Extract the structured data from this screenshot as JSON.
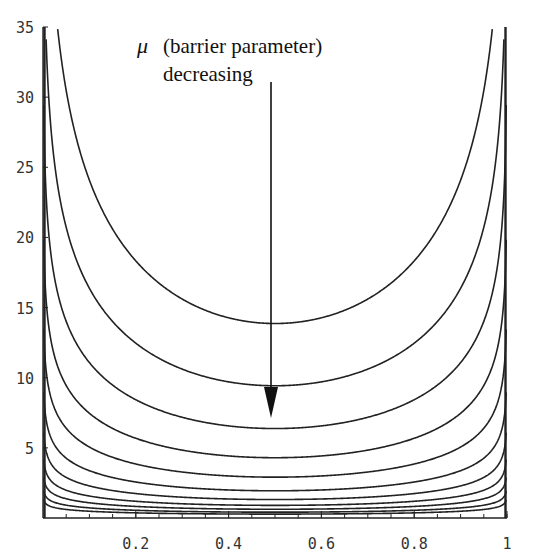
{
  "chart_data": {
    "type": "line",
    "title": "",
    "xlabel": "",
    "ylabel": "",
    "function": "f(x) = -mu * (ln(x) + ln(1 - x))",
    "xlim": [
      0,
      1
    ],
    "ylim": [
      0,
      35
    ],
    "x_ticks": [
      0.2,
      0.4,
      0.6,
      0.8,
      1
    ],
    "x_tick_labels": [
      "0.2",
      "0.4",
      "0.6",
      "0.8",
      "1"
    ],
    "x_minor_tick_step": 0.05,
    "y_ticks": [
      5,
      10,
      15,
      20,
      25,
      30,
      35
    ],
    "y_tick_labels": [
      "5",
      "10",
      "15",
      "20",
      "25",
      "30",
      "35"
    ],
    "grid": false,
    "legend": null,
    "series": [
      {
        "name": "mu=10",
        "mu": 10.0,
        "min_at_x_0.5": 13.9
      },
      {
        "name": "mu=6.8",
        "mu": 6.8,
        "min_at_x_0.5": 9.4
      },
      {
        "name": "mu=4.6",
        "mu": 4.6,
        "min_at_x_0.5": 6.4
      },
      {
        "name": "mu=3.1",
        "mu": 3.1,
        "min_at_x_0.5": 4.3
      },
      {
        "name": "mu=2.1",
        "mu": 2.1,
        "min_at_x_0.5": 2.9
      },
      {
        "name": "mu=1.4",
        "mu": 1.4,
        "min_at_x_0.5": 1.9
      },
      {
        "name": "mu=0.95",
        "mu": 0.95,
        "min_at_x_0.5": 1.3
      },
      {
        "name": "mu=0.65",
        "mu": 0.65,
        "min_at_x_0.5": 0.9
      },
      {
        "name": "mu=0.45",
        "mu": 0.45,
        "min_at_x_0.5": 0.6
      },
      {
        "name": "mu=0.3",
        "mu": 0.3,
        "min_at_x_0.5": 0.4
      },
      {
        "name": "mu=0.2",
        "mu": 0.2,
        "min_at_x_0.5": 0.3
      }
    ],
    "annotations": [
      {
        "text_symbol": "μ",
        "text": "(barrier parameter)",
        "line2": "decreasing",
        "arrow": {
          "x": 0.49,
          "from_y": 31.4,
          "to_y": 7.2,
          "direction": "down"
        }
      }
    ]
  },
  "annotation": {
    "symbol": "μ",
    "line1": "(barrier parameter)",
    "line2": "decreasing"
  },
  "colors": {
    "line": "#222222",
    "text": "#333333",
    "background": "#ffffff"
  }
}
